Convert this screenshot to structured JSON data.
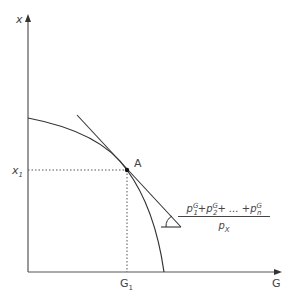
{
  "diagram": {
    "type": "production-possibility-frontier",
    "y_axis_label": "x",
    "x_axis_label": "G",
    "point_label": "A",
    "y_tick": {
      "base": "x",
      "sub": "1"
    },
    "x_tick": {
      "base": "G",
      "sub": "1"
    },
    "slope_fraction": {
      "numerator_terms": [
        {
          "base": "p",
          "sub": "1",
          "sup": "G"
        },
        {
          "base": "p",
          "sub": "2",
          "sup": "G"
        },
        {
          "base": "p",
          "sub": "n",
          "sup": "G"
        }
      ],
      "numerator_text": "p1G + p2G + ... + pnG",
      "plus": "+",
      "ellipsis": "+ ... +",
      "denominator": {
        "base": "p",
        "sub": "X"
      }
    },
    "colors": {
      "axis": "#555555",
      "curve": "#333333",
      "dotted": "#555555",
      "text": "#444444"
    }
  }
}
